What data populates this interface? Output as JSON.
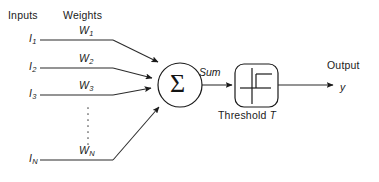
{
  "diagram": {
    "headers": {
      "inputs": "Inputs",
      "weights": "Weights"
    },
    "inputs": [
      {
        "label": "I",
        "sub": "1",
        "weight_label": "W",
        "weight_sub": "1"
      },
      {
        "label": "I",
        "sub": "2",
        "weight_label": "W",
        "weight_sub": "2"
      },
      {
        "label": "I",
        "sub": "3",
        "weight_label": "W",
        "weight_sub": "3"
      },
      {
        "label": "I",
        "sub": "N",
        "weight_label": "W",
        "weight_sub": "N"
      }
    ],
    "summation": {
      "symbol": "Σ",
      "output_label": "Sum"
    },
    "activation": {
      "name": "Threshold",
      "param": "T",
      "caption_name": "Threshold",
      "caption_param": "T",
      "function_type": "step"
    },
    "output": {
      "header": "Output",
      "variable": "y"
    },
    "ellipsis": "vertical-dots",
    "colors": {
      "ink": "#1a1a1a",
      "line": "#2b2b2b",
      "background": "#ffffff"
    }
  }
}
